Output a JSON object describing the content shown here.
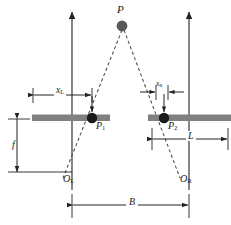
{
  "figure": {
    "type": "stereo-vision-geometry-diagram",
    "background_color": "#ffffff",
    "line_color": "#222222",
    "image_plane_color": "#808080",
    "point_color": "#1a1a1a",
    "world_point_color": "#595959"
  },
  "labels": {
    "world_point": "P",
    "left_projection": "P",
    "left_projection_sub": "1",
    "right_projection": "P",
    "right_projection_sub": "2",
    "left_origin": "O",
    "left_origin_sub": "L",
    "right_origin": "O",
    "right_origin_sub": "R",
    "left_offset": "x",
    "left_offset_sub": "L",
    "right_offset": "x",
    "right_offset_sub": "R",
    "focal_length": "f",
    "baseline": "B",
    "sensor_half_width": "L"
  },
  "dimensions": {
    "focal_length": {
      "label": "f",
      "orientation": "vertical",
      "x": 17,
      "y1": 119,
      "y2": 172
    },
    "baseline": {
      "label": "B",
      "orientation": "horizontal",
      "y": 205,
      "x1": 72,
      "x2": 189
    },
    "left_offset": {
      "label": "xL",
      "orientation": "horizontal",
      "y": 95,
      "x1": 33,
      "x2": 92
    },
    "right_offset": {
      "label": "xR",
      "orientation": "horizontal",
      "y": 92,
      "x1": 152,
      "x2": 175
    },
    "sensor_half_width": {
      "label": "L",
      "orientation": "horizontal",
      "y": 138,
      "x1": 152,
      "x2": 228
    }
  },
  "geometry": {
    "left_axis_x": 72,
    "right_axis_x": 189,
    "image_plane_y": 118,
    "left_plane_x1": 32,
    "left_plane_x2": 110,
    "right_plane_x1": 148,
    "right_plane_x2": 231,
    "world_point": {
      "x": 122,
      "y": 26
    },
    "left_point": {
      "x": 92,
      "y": 118
    },
    "right_point": {
      "x": 164,
      "y": 118
    },
    "axis_top_y": 10,
    "axis_bottom_y": 190
  }
}
